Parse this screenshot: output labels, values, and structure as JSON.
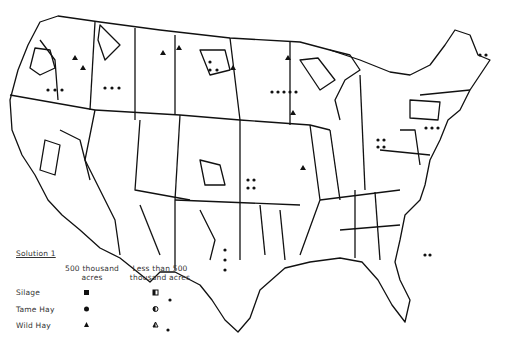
{
  "legend": {
    "title": "Solution 1",
    "col1": [
      "500 thousand",
      "acres"
    ],
    "col2": [
      "Less than 500",
      "thousand acres"
    ],
    "rows": [
      {
        "label": "Silage",
        "full": "filled-square",
        "partial": "half-square"
      },
      {
        "label": "Tame Hay",
        "full": "filled-circle",
        "partial": "half-circle"
      },
      {
        "label": "Wild Hay",
        "full": "filled-triangle",
        "partial": "half-triangle"
      }
    ]
  },
  "map": {
    "subject": "United States production regions",
    "line_color": "#111111",
    "background": "#ffffff"
  }
}
